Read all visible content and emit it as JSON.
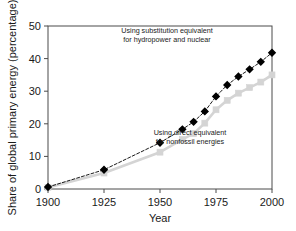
{
  "chart_data": {
    "type": "line",
    "title": "",
    "xlabel": "Year",
    "ylabel": "Share of global primary energy (percentage)",
    "xlim": [
      1900,
      2000
    ],
    "ylim": [
      0,
      50
    ],
    "xticks": [
      1900,
      1925,
      1950,
      1975,
      2000
    ],
    "yticks": [
      0,
      10,
      20,
      30,
      40,
      50
    ],
    "grid": false,
    "legend_position": "inline-annotations",
    "series": [
      {
        "name": "Using substitution equivalent for hydropower and nuclear",
        "color": "#000000",
        "marker": "filled-diamond",
        "linestyle": "dash-dot",
        "x": [
          1900,
          1925,
          1950,
          1960,
          1965,
          1970,
          1975,
          1980,
          1985,
          1990,
          1995,
          2000
        ],
        "values": [
          0.6,
          5.9,
          14.2,
          18.3,
          20.6,
          23.8,
          28.4,
          31.9,
          34.5,
          36.7,
          39.0,
          41.8
        ]
      },
      {
        "name": "Using direct equivalent for nonfossil energies",
        "color": "#d4d4d4",
        "marker": "filled-square",
        "linestyle": "solid",
        "x": [
          1900,
          1925,
          1950,
          1960,
          1965,
          1970,
          1975,
          1980,
          1985,
          1990,
          1995,
          2000
        ],
        "values": [
          0.5,
          4.9,
          11.3,
          15.2,
          17.0,
          20.2,
          24.3,
          27.2,
          29.4,
          31.1,
          32.8,
          35.0
        ]
      }
    ],
    "annotations": [
      {
        "id": "substitution-note",
        "lines": [
          "Using substitution equivalent",
          "for hydropower and nuclear"
        ],
        "x_px": 167,
        "y_px": 33
      },
      {
        "id": "direct-note",
        "lines": [
          "Using direct equivalent",
          "for nonfossil energies"
        ],
        "x_px": 190,
        "y_px": 135
      }
    ]
  }
}
